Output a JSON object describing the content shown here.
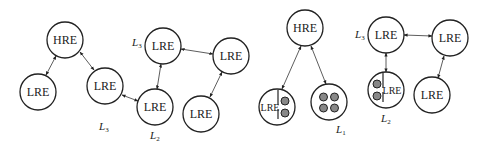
{
  "diagram": {
    "node_radius": 18,
    "left_graph": {
      "nodes": [
        {
          "id": "l-hre",
          "label": "HRE",
          "x": 65,
          "y": 40
        },
        {
          "id": "l-lre-a",
          "label": "LRE",
          "x": 38,
          "y": 92
        },
        {
          "id": "l-lre-b",
          "label": "LRE",
          "x": 105,
          "y": 86
        },
        {
          "id": "l-lre-c",
          "label": "LRE",
          "x": 155,
          "y": 107
        },
        {
          "id": "l-lre-d",
          "label": "LRE",
          "x": 163,
          "y": 46
        },
        {
          "id": "l-lre-e",
          "label": "LRE",
          "x": 231,
          "y": 56
        },
        {
          "id": "l-lre-f",
          "label": "LRE",
          "x": 201,
          "y": 114
        }
      ],
      "level_labels": [
        {
          "text": "L",
          "sub": "3",
          "x": 132,
          "y": 46
        },
        {
          "text": "L",
          "sub": "3",
          "x": 99,
          "y": 130
        },
        {
          "text": "L",
          "sub": "2",
          "x": 150,
          "y": 139
        }
      ]
    },
    "right_graph": {
      "nodes": [
        {
          "id": "r-hre",
          "label": "HRE",
          "x": 305,
          "y": 28
        },
        {
          "id": "r-lre-split-a",
          "label": "LRE",
          "x": 277,
          "y": 107,
          "type": "split-left"
        },
        {
          "id": "r-quad",
          "label": "",
          "x": 329,
          "y": 102,
          "type": "quad"
        },
        {
          "id": "r-lre-top",
          "label": "LRE",
          "x": 386,
          "y": 35
        },
        {
          "id": "r-lre-right",
          "label": "LRE",
          "x": 450,
          "y": 38
        },
        {
          "id": "r-lre-split-b",
          "label": "LRE",
          "x": 386,
          "y": 90,
          "type": "split-right"
        },
        {
          "id": "r-lre-low",
          "label": "LRE",
          "x": 432,
          "y": 95
        }
      ],
      "level_labels": [
        {
          "text": "L",
          "sub": "3",
          "x": 355,
          "y": 38
        },
        {
          "text": "L",
          "sub": "1",
          "x": 336,
          "y": 133
        },
        {
          "text": "L",
          "sub": "2",
          "x": 381,
          "y": 122
        }
      ]
    }
  }
}
